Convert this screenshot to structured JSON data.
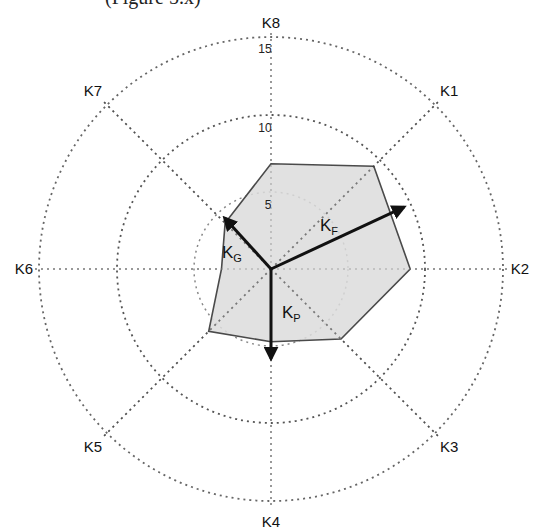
{
  "caption": "(Figure 5.x)",
  "chart_data": {
    "type": "radar",
    "title": "",
    "axes": [
      "K1",
      "K2",
      "K3",
      "K4",
      "K5",
      "K6",
      "K7",
      "K8"
    ],
    "radial_ticks": [
      "5",
      "10",
      "15"
    ],
    "rlim": [
      0,
      15
    ],
    "grid": "dotted concentric circles and dotted spokes",
    "series": [
      {
        "name": "profile",
        "values": {
          "K1": 9.4,
          "K2": 9.0,
          "K3": 6.4,
          "K4": 4.7,
          "K5": 5.7,
          "K6": 3.2,
          "K7": 4.2,
          "K8": 6.8
        },
        "fill": "#d9d9d9",
        "stroke": "#555555"
      }
    ],
    "vectors": [
      {
        "name": "KF",
        "label": "K",
        "sub": "F",
        "dx": 8.6,
        "dy": 4.0
      },
      {
        "name": "KG",
        "label": "K",
        "sub": "G",
        "dx": -3.0,
        "dy": 3.3
      },
      {
        "name": "KP",
        "label": "K",
        "sub": "P",
        "dx": 0.0,
        "dy": -5.8
      }
    ]
  }
}
